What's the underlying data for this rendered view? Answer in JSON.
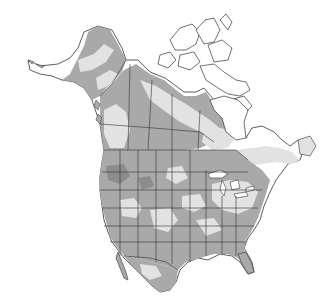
{
  "map": {
    "region": "North America",
    "description": "Range / distribution map with gray shading over North America (Alaska, Canada, USA, Mexico)",
    "colors": {
      "background": "#ffffff",
      "land_unshaded": "#ffffff",
      "shade_light": "#e2e2e2",
      "shade_medium": "#a9a9a9",
      "shade_dark": "#8c8c8c",
      "boundary": "#333333"
    },
    "legend": null,
    "labels": []
  }
}
